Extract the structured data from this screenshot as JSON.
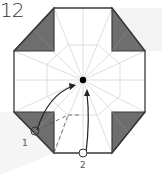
{
  "step": {
    "number": "12"
  },
  "labels": {
    "point_1": "1",
    "point_2": "2"
  },
  "colors": {
    "outline": "#3a3a3a",
    "fold_line": "#d8d8d8",
    "shaded_flap": "#6e6e6e",
    "background_shade": "#f1f1f1",
    "arrow": "#222222",
    "center_dot": "#000000"
  }
}
